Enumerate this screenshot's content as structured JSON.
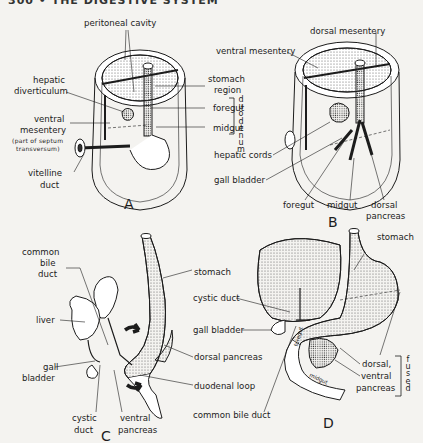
{
  "header": {
    "text": "300 • THE DIGESTIVE SYSTEM"
  },
  "panels": {
    "A": {
      "letter": "A",
      "labels": {
        "peritoneal_cavity": "peritoneal cavity",
        "hepatic_diverticulum_1": "hepatic",
        "hepatic_diverticulum_2": "diverticulum",
        "ventral_mesentery_1": "ventral",
        "ventral_mesentery_2": "mesentery",
        "septum_1": "(part of septum",
        "septum_2": "transversum)",
        "vitelline_1": "vitelline",
        "vitelline_2": "duct",
        "stomach_region_1": "stomach",
        "stomach_region_2": "region",
        "foregut": "foregut",
        "midgut": "midgut",
        "duodenum": "duodenum"
      }
    },
    "B": {
      "letter": "B",
      "labels": {
        "dorsal_mesentery": "dorsal mesentery",
        "ventral_mesentery": "ventral mesentery",
        "hepatic_cords": "hepatic cords",
        "gall_bladder": "gall bladder",
        "foregut": "foregut",
        "midgut": "midgut",
        "dorsal_pancreas_1": "dorsal",
        "dorsal_pancreas_2": "pancreas"
      }
    },
    "C": {
      "letter": "C",
      "labels": {
        "common_bile_1": "common",
        "common_bile_2": "bile",
        "common_bile_3": "duct",
        "liver": "liver",
        "gall_1": "gall",
        "gall_2": "bladder",
        "cystic_1": "cystic",
        "cystic_2": "duct",
        "ventral_pancreas_1": "ventral",
        "ventral_pancreas_2": "pancreas",
        "stomach": "stomach",
        "dorsal_pancreas": "dorsal pancreas",
        "duodenal_loop": "duodenal loop"
      }
    },
    "D": {
      "letter": "D",
      "labels": {
        "stomach": "stomach",
        "cystic_duct": "cystic duct",
        "gall_bladder": "gall bladder",
        "common_bile_duct": "common bile duct",
        "dorsal_ventral_1": "dorsal,",
        "dorsal_ventral_2": "ventral",
        "dorsal_ventral_3": "pancreas",
        "fused": "fused",
        "foregut_inner": "foregut",
        "midgut_inner": "midgut"
      }
    }
  },
  "colors": {
    "ink": "#1c1c1c",
    "paper": "#f4f3f0",
    "stipple": "#8a8a8a"
  }
}
